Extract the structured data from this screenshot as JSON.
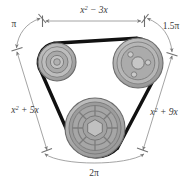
{
  "figure": {
    "background_color": "#ffffff"
  },
  "labels": {
    "top": "x² − 3x",
    "top_left": "π",
    "top_right": "1.5π",
    "left": "x² + 5x",
    "right": "x² + 9x",
    "bottom": "2π"
  },
  "label_parts": {
    "top_base": "x",
    "top_exp": "2",
    "top_rest": " − 3x",
    "left_base": "x",
    "left_exp": "2",
    "left_rest": " + 5x",
    "right_base": "x",
    "right_exp": "2",
    "right_rest": " + 9x"
  },
  "pulleys": [
    {
      "name": "upper-left-pulley",
      "cx": 57,
      "cy": 62,
      "outer_r": 19,
      "rings": [
        19,
        15.5,
        11,
        6.5,
        3.5
      ],
      "style": "concentric",
      "fill": "#a8a8a8"
    },
    {
      "name": "upper-right-pulley",
      "cx": 138,
      "cy": 63,
      "outer_r": 25,
      "rings": [
        25,
        21,
        17
      ],
      "style": "bolt-holes",
      "hub_r": 6,
      "bolt_r": 2.6,
      "bolt_count": 3,
      "fill": "#a8a8a8"
    },
    {
      "name": "lower-center-pulley",
      "cx": 95,
      "cy": 128,
      "outer_r": 30,
      "rings": [
        30,
        26,
        22,
        16,
        11
      ],
      "style": "spoked-fan",
      "spoke_count": 8,
      "hub_r": 8,
      "fill": "#9e9e9e"
    }
  ],
  "colors": {
    "pulley_body": "#a8a8a8",
    "pulley_light": "#c7c7c7",
    "pulley_dark": "#8a8a8a",
    "belt": "#111111",
    "dimension_line": "#8d8d8d",
    "label_text": "#3a3a3a",
    "outline": "#6b6b6b"
  },
  "belt": {
    "name": "drive-belt",
    "stroke_width": 3.2,
    "description": "Closed belt wrapping the three pulleys"
  },
  "dimensions": [
    {
      "name": "top-span",
      "label": "x² − 3x",
      "style": "straight-double-arrow"
    },
    {
      "name": "left-span",
      "label": "x² + 5x",
      "style": "straight-double-arrow"
    },
    {
      "name": "right-span",
      "label": "x² + 9x",
      "style": "straight-double-arrow"
    },
    {
      "name": "upper-left-arc",
      "label": "π",
      "style": "arc-arrow"
    },
    {
      "name": "upper-right-arc",
      "label": "1.5π",
      "style": "arc-arrow"
    },
    {
      "name": "bottom-arc",
      "label": "2π",
      "style": "arc-arrow"
    }
  ]
}
